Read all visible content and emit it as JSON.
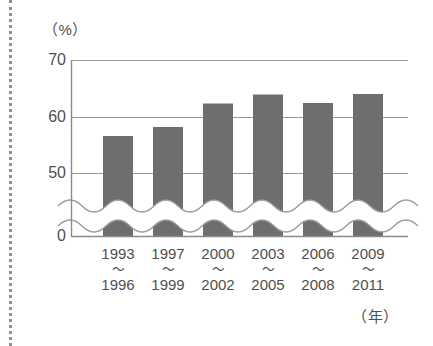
{
  "chart_data": {
    "type": "bar",
    "title": "",
    "subtitle": "",
    "xlabel": "（年）",
    "ylabel": "（%）",
    "categories": [
      "1993〜1996",
      "1997〜1999",
      "2000〜2002",
      "2003〜2005",
      "2006〜2008",
      "2009〜2011"
    ],
    "category_parts": [
      {
        "from": "1993",
        "sep": "〜",
        "to": "1996"
      },
      {
        "from": "1997",
        "sep": "〜",
        "to": "1999"
      },
      {
        "from": "2000",
        "sep": "〜",
        "to": "2002"
      },
      {
        "from": "2003",
        "sep": "〜",
        "to": "2005"
      },
      {
        "from": "2006",
        "sep": "〜",
        "to": "2008"
      },
      {
        "from": "2009",
        "sep": "〜",
        "to": "2011"
      }
    ],
    "values": [
      53.1,
      54.1,
      56.7,
      58.3,
      62.5,
      64.1
    ],
    "ylim": [
      0,
      70
    ],
    "ytick_labels": [
      "70",
      "60",
      "50",
      "0"
    ],
    "ytick_values": [
      70,
      60,
      50,
      0
    ],
    "axis_break": true,
    "axis_break_note": "wavy break between 0 and 50 on the value axis",
    "grid": "horizontal gridlines at 50, 60, 70",
    "legend": "none",
    "bar_color": "#6e6e6e",
    "axis_color": "#8a8a8a",
    "grid_color": "#9a9a9a",
    "text_color": "#4f4f4f"
  }
}
